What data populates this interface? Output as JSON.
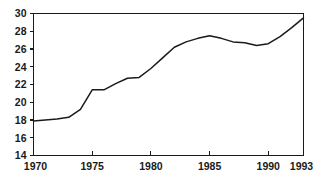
{
  "chart_data": {
    "type": "line",
    "title": "",
    "subtitle": "",
    "xlabel": "",
    "ylabel": "",
    "xlim": [
      1970,
      1993
    ],
    "ylim": [
      14,
      30
    ],
    "grid": false,
    "legend": null,
    "x_ticks": [
      1970,
      1975,
      1980,
      1985,
      1990,
      1993
    ],
    "x_tick_labels": [
      "1970",
      "1975",
      "1980",
      "1985",
      "1990",
      "1993"
    ],
    "y_ticks": [
      14,
      16,
      18,
      20,
      22,
      24,
      26,
      28,
      30
    ],
    "y_tick_labels": [
      "14",
      "16",
      "18",
      "20",
      "22",
      "24",
      "26",
      "28",
      "30"
    ],
    "line_color": "#1a1a1a",
    "background_color": "#ffffff",
    "x": [
      1970,
      1971,
      1972,
      1973,
      1974,
      1975,
      1976,
      1977,
      1978,
      1979,
      1980,
      1981,
      1982,
      1983,
      1984,
      1985,
      1986,
      1987,
      1988,
      1989,
      1990,
      1991,
      1992,
      1993
    ],
    "series": [
      {
        "name": "value",
        "values": [
          17.9,
          18.0,
          18.1,
          18.3,
          19.2,
          21.4,
          21.4,
          22.1,
          22.7,
          22.8,
          23.8,
          25.0,
          26.2,
          26.8,
          27.2,
          27.5,
          27.2,
          26.8,
          26.7,
          26.4,
          26.6,
          27.4,
          28.4,
          29.5
        ]
      }
    ]
  },
  "axes": {
    "frame_color": "#1a1a1a"
  }
}
